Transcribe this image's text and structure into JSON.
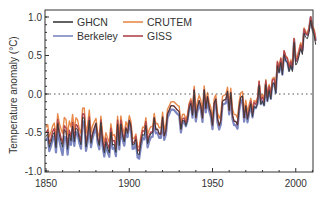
{
  "chart_data": {
    "type": "line",
    "title": "",
    "xlabel": "",
    "ylabel": "Temperature anomaly (°C)",
    "xlim": [
      1850,
      2012
    ],
    "ylim": [
      -1.05,
      1.05
    ],
    "x_ticks": [
      1850,
      1900,
      1950,
      2000
    ],
    "x_tick_labels": [
      "1850",
      "1900",
      "1950",
      "2000"
    ],
    "y_ticks": [
      1.0,
      0.5,
      0.0,
      -0.5,
      -1.0
    ],
    "y_tick_labels": [
      "1.0",
      "0.5",
      "0.0",
      "-0.5",
      "-1.0"
    ],
    "grid": false,
    "reference_line": {
      "y": 0.0,
      "style": "dotted"
    },
    "legend": {
      "position": "upper left",
      "columns": 2,
      "entries": [
        "GHCN",
        "CRUTEM",
        "Berkeley",
        "GISS"
      ]
    },
    "x": [
      1850,
      1855,
      1860,
      1865,
      1870,
      1875,
      1880,
      1885,
      1890,
      1895,
      1900,
      1905,
      1910,
      1915,
      1920,
      1925,
      1930,
      1935,
      1940,
      1945,
      1950,
      1955,
      1960,
      1965,
      1970,
      1975,
      1980,
      1985,
      1990,
      1995,
      2000,
      2005,
      2010
    ],
    "series": [
      {
        "name": "GHCN",
        "color": "#3a3a3a",
        "values": [
          -0.55,
          -0.5,
          -0.6,
          -0.5,
          -0.45,
          -0.55,
          -0.45,
          -0.65,
          -0.6,
          -0.55,
          -0.45,
          -0.6,
          -0.6,
          -0.45,
          -0.4,
          -0.35,
          -0.25,
          -0.3,
          -0.1,
          -0.15,
          -0.25,
          -0.2,
          -0.1,
          -0.2,
          -0.15,
          -0.1,
          0.05,
          0.1,
          0.3,
          0.35,
          0.55,
          0.75,
          0.8
        ]
      },
      {
        "name": "CRUTEM",
        "color": "#e8894a",
        "values": [
          -0.45,
          -0.4,
          -0.45,
          -0.35,
          -0.35,
          -0.4,
          -0.4,
          -0.55,
          -0.5,
          -0.45,
          -0.4,
          -0.55,
          -0.5,
          -0.4,
          -0.35,
          -0.3,
          -0.2,
          -0.25,
          -0.05,
          -0.1,
          -0.2,
          -0.15,
          -0.05,
          -0.15,
          -0.1,
          -0.05,
          0.1,
          0.15,
          0.35,
          0.4,
          0.6,
          0.8,
          0.85
        ]
      },
      {
        "name": "Berkeley",
        "color": "#7b86c0",
        "values": [
          -0.6,
          -0.55,
          -0.7,
          -0.55,
          -0.5,
          -0.6,
          -0.5,
          -0.7,
          -0.65,
          -0.6,
          -0.5,
          -0.65,
          -0.65,
          -0.5,
          -0.45,
          -0.4,
          -0.3,
          -0.3,
          -0.15,
          -0.2,
          -0.3,
          -0.25,
          -0.15,
          -0.25,
          -0.2,
          -0.1,
          0.05,
          0.1,
          0.3,
          0.35,
          0.6,
          0.8,
          0.85
        ]
      },
      {
        "name": "GISS",
        "color": "#b0464f",
        "values": [
          -0.5,
          -0.45,
          -0.55,
          -0.45,
          -0.4,
          -0.5,
          -0.45,
          -0.6,
          -0.55,
          -0.5,
          -0.45,
          -0.55,
          -0.55,
          -0.45,
          -0.4,
          -0.35,
          -0.25,
          -0.25,
          -0.1,
          -0.15,
          -0.25,
          -0.2,
          -0.1,
          -0.2,
          -0.15,
          -0.05,
          0.1,
          0.15,
          0.35,
          0.4,
          0.6,
          0.8,
          0.85
        ]
      }
    ]
  },
  "frame": {
    "left": 45,
    "top": 10,
    "right": 313,
    "bottom": 172
  }
}
